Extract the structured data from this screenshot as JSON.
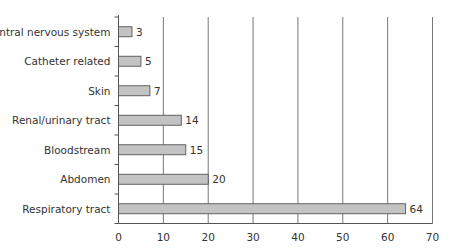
{
  "chart_data": {
    "type": "bar",
    "orientation": "horizontal",
    "title": "",
    "xlabel": "",
    "ylabel": "",
    "categories": [
      "Central nervous system",
      "Catheter related",
      "Skin",
      "Renal/urinary tract",
      "Bloodstream",
      "Abdomen",
      "Respiratory tract"
    ],
    "values": [
      3,
      5,
      7,
      14,
      15,
      20,
      64
    ],
    "xlim": [
      0,
      70
    ],
    "xticks": [
      0,
      10,
      20,
      30,
      40,
      50,
      60,
      70
    ],
    "grid": "vertical",
    "data_labels": true,
    "legend": null,
    "colors": {
      "bar_fill": "#c3c3c3",
      "bar_stroke": "#555555",
      "grid": "#555555",
      "axis": "#555555",
      "text": "#333333"
    }
  }
}
